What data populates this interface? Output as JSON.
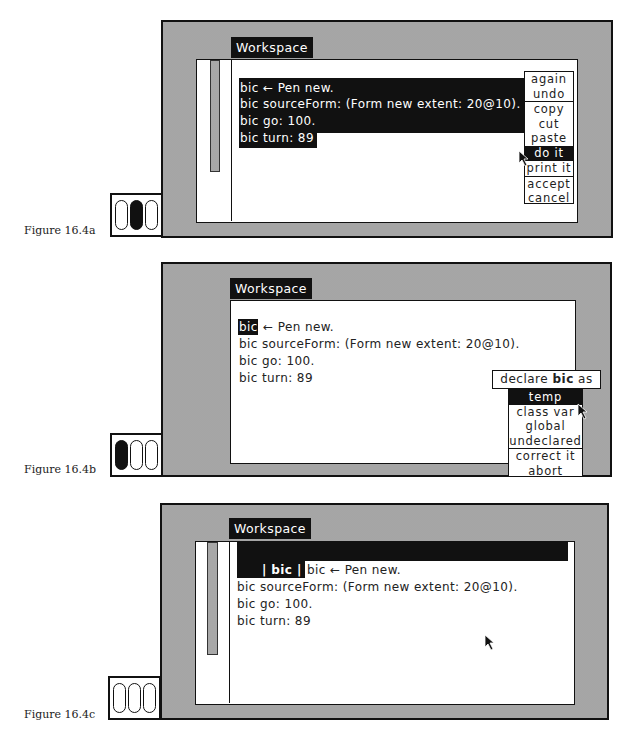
{
  "figures": [
    {
      "caption": "Figure 16.4a",
      "window_title": "Workspace",
      "code_lines": [
        "bic ← Pen new.",
        "bic sourceForm: (Form new extent: 20@10).",
        "bic go: 100.",
        "bic turn: 89"
      ],
      "selection": "all code selected",
      "menu": {
        "items": [
          {
            "label": "again"
          },
          {
            "label": "undo"
          },
          {
            "label": "copy"
          },
          {
            "label": "cut"
          },
          {
            "label": "paste"
          },
          {
            "label": "do it",
            "highlighted": true
          },
          {
            "label": "print it"
          },
          {
            "label": "accept"
          },
          {
            "label": "cancel"
          }
        ]
      },
      "mouse_buttons": [
        "off",
        "on",
        "off"
      ]
    },
    {
      "caption": "Figure 16.4b",
      "window_title": "Workspace",
      "code_lines": [
        "← Pen new.",
        "bic sourceForm: (Form new extent: 20@10).",
        "bic go: 100.",
        "bic turn: 89"
      ],
      "highlighted_word": "bic",
      "declare_prompt": {
        "prefix": "declare ",
        "variable": "bic",
        "suffix": " as"
      },
      "menu": {
        "items": [
          {
            "label": "temp",
            "highlighted": true
          },
          {
            "label": "class var"
          },
          {
            "label": "global"
          },
          {
            "label": "undeclared"
          },
          {
            "label": "correct it"
          },
          {
            "label": "abort"
          }
        ]
      },
      "mouse_buttons": [
        "on",
        "off",
        "off"
      ]
    },
    {
      "caption": "Figure 16.4c",
      "window_title": "Workspace",
      "inserted_declaration": "| bic |",
      "code_lines": [
        "bic ← Pen new.",
        "bic sourceForm: (Form new extent: 20@10).",
        "bic go: 100.",
        "bic turn: 89"
      ],
      "mouse_buttons": [
        "off",
        "off",
        "off"
      ]
    }
  ]
}
